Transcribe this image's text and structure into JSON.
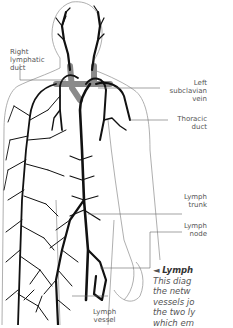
{
  "figure": {
    "type": "anatomical lymphatic system diagram",
    "labels": {
      "right_lymphatic_duct": "Right\nlymphatic\nduct",
      "left_subclavian_vein": "Left\nsubclavian\nvein",
      "thoracic_duct": "Thoracic\nduct",
      "lymph_trunk": "Lymph\ntrunk",
      "lymph_node": "Lymph\nnode",
      "lymph_vessel": "Lymph\nvessel"
    },
    "caption": {
      "marker": "◄",
      "title": "Lymph",
      "lines": [
        "This diag",
        "the netw",
        "vessels jo",
        "the two ly",
        "which em"
      ]
    },
    "colors": {
      "vessel": "#111111",
      "vein": "#8a8a8a",
      "outline": "#9a9a9a",
      "label": "#555555",
      "leader": "#666666"
    }
  }
}
